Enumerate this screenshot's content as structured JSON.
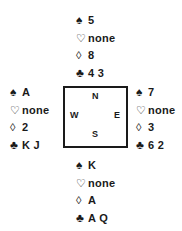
{
  "diagram": {
    "type": "bridge-deal",
    "suit_symbols": {
      "spades": "♠",
      "hearts": "♡",
      "diamonds": "◊",
      "clubs": "♣"
    },
    "compass": {
      "north": "N",
      "west": "W",
      "east": "E",
      "south": "S"
    },
    "hands": {
      "north": {
        "spades": "5",
        "hearts": "none",
        "diamonds": "8",
        "clubs": "4 3"
      },
      "west": {
        "spades": "A",
        "hearts": "none",
        "diamonds": "2",
        "clubs": "K J"
      },
      "east": {
        "spades": "7",
        "hearts": "none",
        "diamonds": "3",
        "clubs": "6 2"
      },
      "south": {
        "spades": "K",
        "hearts": "none",
        "diamonds": "A",
        "clubs": "A Q"
      }
    }
  }
}
